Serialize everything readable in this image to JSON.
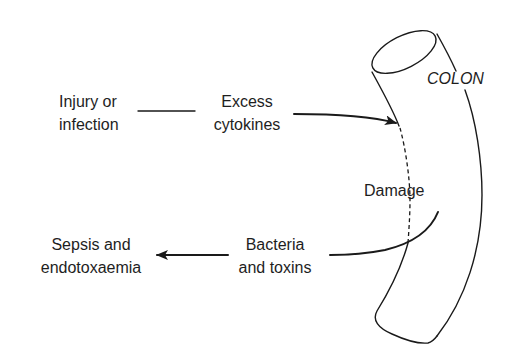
{
  "diagram": {
    "type": "flow-pathophysiology",
    "organ_label": "COLON",
    "nodes": [
      {
        "id": "injury",
        "lines": [
          "Injury or",
          "infection"
        ]
      },
      {
        "id": "cytokines",
        "lines": [
          "Excess",
          "cytokines"
        ]
      },
      {
        "id": "damage",
        "lines": [
          "Damage"
        ]
      },
      {
        "id": "bacteria",
        "lines": [
          "Bacteria",
          "and toxins"
        ]
      },
      {
        "id": "sepsis",
        "lines": [
          "Sepsis and",
          "endotoxaemia"
        ]
      }
    ],
    "edges": [
      {
        "from": "injury",
        "to": "cytokines",
        "style": "line"
      },
      {
        "from": "cytokines",
        "to": "colon",
        "style": "arrow"
      },
      {
        "from": "colon",
        "to": "bacteria",
        "style": "curved-line"
      },
      {
        "from": "bacteria",
        "to": "sepsis",
        "style": "arrow"
      }
    ],
    "colors": {
      "stroke": "#1a1a1a",
      "text": "#1e1e1e",
      "background": "#ffffff"
    }
  }
}
